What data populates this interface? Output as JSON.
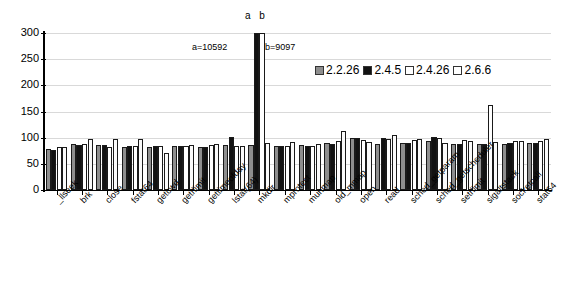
{
  "chart_data": {
    "type": "bar",
    "title": "",
    "subtitle": "",
    "xlabel": "",
    "ylabel": "",
    "ylim": [
      0,
      300
    ],
    "yticks": [
      0,
      50,
      100,
      150,
      200,
      250,
      300
    ],
    "grid": true,
    "legend_position": "top-right",
    "categories": [
      "_llseek",
      "brk",
      "close",
      "fstat64",
      "getcwd",
      "getrlimit",
      "gettimeofday",
      "lstat(64)",
      "mkdir",
      "mprotect",
      "munmap",
      "old_mmap",
      "open",
      "read",
      "sched_getparam",
      "sched_getscheduler",
      "setrlimit",
      "sigaltstack",
      "socketcall",
      "stat64"
    ],
    "series": [
      {
        "name": "2.2.26",
        "color": "#8e8e8e",
        "values": [
          79,
          87,
          86,
          83,
          83,
          84,
          83,
          86,
          86,
          85,
          86,
          89,
          99,
          88,
          90,
          93,
          88,
          87,
          87,
          89
        ]
      },
      {
        "name": "2.4.5",
        "color": "#121212",
        "values": [
          76,
          86,
          86,
          84,
          84,
          84,
          83,
          101,
          306,
          85,
          84,
          88,
          99,
          100,
          89,
          101,
          88,
          88,
          89,
          90
        ]
      },
      {
        "name": "2.4.26",
        "color": "#ffffff",
        "values": [
          83,
          87,
          82,
          84,
          84,
          84,
          86,
          85,
          306,
          85,
          85,
          93,
          96,
          97,
          96,
          99,
          95,
          163,
          94,
          94
        ]
      },
      {
        "name": "2.6.6",
        "color": "#fbfbfb",
        "values": [
          82,
          98,
          98,
          98,
          70,
          86,
          88,
          85,
          89,
          91,
          87,
          112,
          92,
          105,
          98,
          90,
          93,
          92,
          93,
          98
        ]
      }
    ],
    "annotations": [
      {
        "text": "a b",
        "note": "marker above off-scale mkdir bars"
      },
      {
        "text": "a=10592",
        "note": "value of 2.4.5 mkdir bar"
      },
      {
        "text": "b=9097",
        "note": "value of 2.4.26 mkdir bar"
      }
    ]
  },
  "legend": {
    "items": [
      {
        "label": "2.2.26",
        "swatch": "#8e8e8e"
      },
      {
        "label": "2.4.5",
        "swatch": "#121212"
      },
      {
        "label": "2.4.26",
        "swatch": "#ffffff"
      },
      {
        "label": "2.6.6",
        "swatch": "#ffffff"
      }
    ]
  },
  "yaxis": {
    "ticks": [
      "300",
      "250",
      "200",
      "150",
      "100",
      "50",
      "0"
    ]
  },
  "annotations": {
    "ab_marker": "a b",
    "a_value": "a=10592",
    "b_value": "b=9097"
  },
  "footer": {
    "clipped_caption": ""
  }
}
